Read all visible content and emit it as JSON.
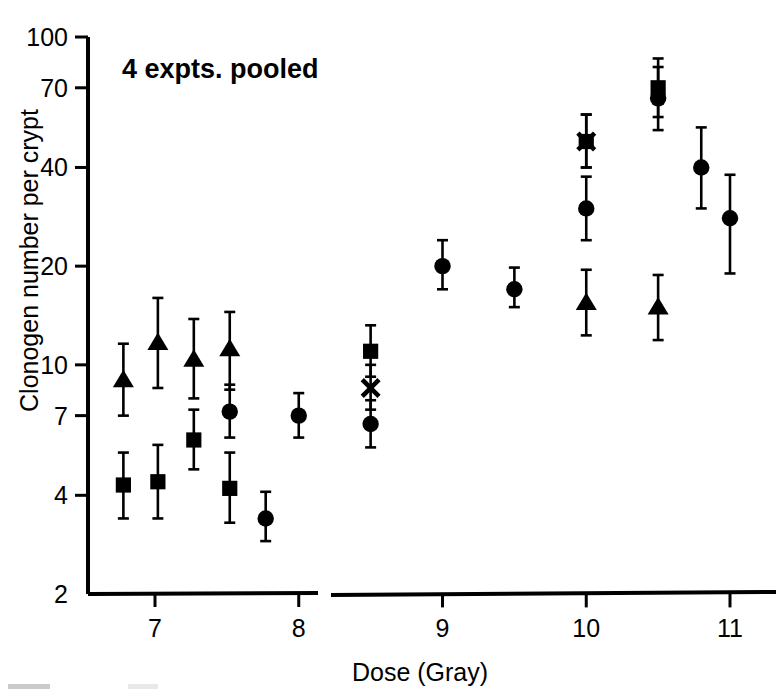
{
  "figure": {
    "panel_title": "4 expts. pooled",
    "background": "#ffffff",
    "ink_color": "#000000"
  },
  "axes": {
    "y_title": "Clonogen number per crypt",
    "x_title": "Dose (Gray)",
    "y_ticks": [
      "100",
      "70",
      "40",
      "20",
      "10",
      "7",
      "4",
      "2"
    ],
    "x_ticks": [
      "7",
      "8",
      "9",
      "10",
      "11"
    ],
    "x_axis_break": "true"
  },
  "chart_data": {
    "type": "scatter",
    "title": "4 expts. pooled",
    "xlabel": "Dose (Gray)",
    "ylabel": "Clonogen number per crypt",
    "yscale": "log",
    "ylim": [
      2,
      100
    ],
    "xlim": [
      6.6,
      11.2
    ],
    "x_axis_break": [
      8.15,
      8.35
    ],
    "grid": "off",
    "legend": "none",
    "y_tick_values": [
      100,
      70,
      40,
      20,
      10,
      7,
      4,
      2
    ],
    "x_tick_values": [
      7,
      8,
      9,
      10,
      11
    ],
    "series": [
      {
        "name": "triangle",
        "marker": "triangle",
        "points": [
          {
            "x": 6.78,
            "y": 9.0,
            "lo": 7.0,
            "hi": 11.6
          },
          {
            "x": 7.02,
            "y": 11.7,
            "lo": 8.5,
            "hi": 16.0
          },
          {
            "x": 7.27,
            "y": 10.4,
            "lo": 7.9,
            "hi": 13.8
          },
          {
            "x": 7.52,
            "y": 11.2,
            "lo": 8.4,
            "hi": 14.5
          },
          {
            "x": 10.0,
            "y": 15.5,
            "lo": 12.3,
            "hi": 19.5
          },
          {
            "x": 10.5,
            "y": 15.0,
            "lo": 11.9,
            "hi": 18.8
          }
        ]
      },
      {
        "name": "square",
        "marker": "square",
        "points": [
          {
            "x": 6.78,
            "y": 4.3,
            "lo": 3.4,
            "hi": 5.4
          },
          {
            "x": 7.02,
            "y": 4.4,
            "lo": 3.4,
            "hi": 5.7
          },
          {
            "x": 7.27,
            "y": 5.9,
            "lo": 4.8,
            "hi": 7.3
          },
          {
            "x": 7.52,
            "y": 4.2,
            "lo": 3.3,
            "hi": 5.4
          },
          {
            "x": 8.5,
            "y": 11.0,
            "lo": 9.2,
            "hi": 13.2
          },
          {
            "x": 10.0,
            "y": 48.0,
            "lo": 40.0,
            "hi": 58.0
          },
          {
            "x": 10.5,
            "y": 70.0,
            "lo": 57.0,
            "hi": 86.0
          }
        ]
      },
      {
        "name": "cross",
        "marker": "x",
        "points": [
          {
            "x": 8.5,
            "y": 8.5,
            "lo": 7.3,
            "hi": 10.0
          },
          {
            "x": 10.0,
            "y": 48.0,
            "lo": 40.0,
            "hi": 58.0
          }
        ]
      },
      {
        "name": "circle",
        "marker": "circle",
        "points": [
          {
            "x": 7.52,
            "y": 7.2,
            "lo": 6.0,
            "hi": 8.7
          },
          {
            "x": 7.77,
            "y": 3.4,
            "lo": 2.9,
            "hi": 4.1
          },
          {
            "x": 8.0,
            "y": 7.0,
            "lo": 6.0,
            "hi": 8.2
          },
          {
            "x": 8.5,
            "y": 6.6,
            "lo": 5.6,
            "hi": 7.8
          },
          {
            "x": 9.0,
            "y": 20.0,
            "lo": 17.0,
            "hi": 24.0
          },
          {
            "x": 9.5,
            "y": 17.0,
            "lo": 15.0,
            "hi": 19.8
          },
          {
            "x": 10.0,
            "y": 30.0,
            "lo": 24.0,
            "hi": 37.5
          },
          {
            "x": 10.5,
            "y": 65.0,
            "lo": 52.0,
            "hi": 81.0
          },
          {
            "x": 10.8,
            "y": 40.0,
            "lo": 30.0,
            "hi": 53.0
          },
          {
            "x": 11.0,
            "y": 28.0,
            "lo": 19.0,
            "hi": 38.0
          }
        ]
      }
    ]
  }
}
